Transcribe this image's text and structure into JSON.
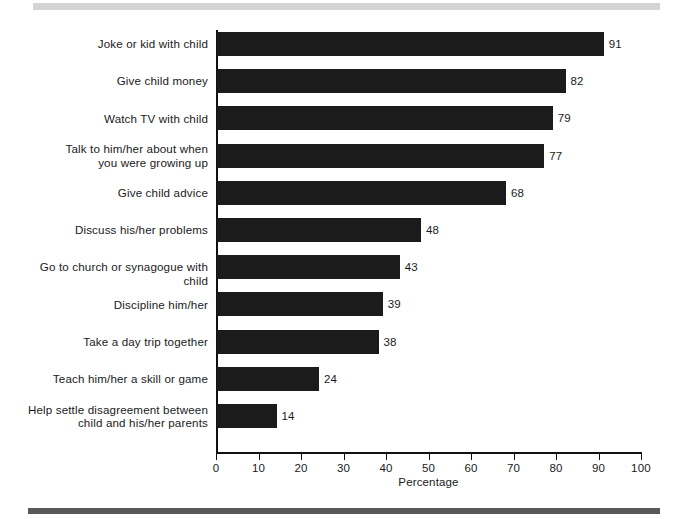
{
  "chart_data": {
    "type": "bar",
    "orientation": "horizontal",
    "title": "",
    "xlabel": "Percentage",
    "ylabel": "",
    "xlim": [
      0,
      100
    ],
    "xticks": [
      0,
      10,
      20,
      30,
      40,
      50,
      60,
      70,
      80,
      90,
      100
    ],
    "grid": false,
    "legend": null,
    "bar_color": "#1b1b1b",
    "show_value_labels": true,
    "categories": [
      "Joke or kid with child",
      "Give child money",
      "Watch TV with child",
      "Talk to him/her about when\nyou were growing up",
      "Give child advice",
      "Discuss his/her problems",
      "Go to church or synagogue with child",
      "Discipline him/her",
      "Take a day trip together",
      "Teach him/her a skill or game",
      "Help settle disagreement between\nchild and his/her parents"
    ],
    "values": [
      91,
      82,
      79,
      77,
      68,
      48,
      43,
      39,
      38,
      24,
      14
    ],
    "value_labels": [
      "91",
      "82",
      "79",
      "77",
      "68",
      "48",
      "43",
      "39",
      "38",
      "24",
      "14"
    ],
    "xtick_labels": [
      "0",
      "10",
      "20",
      "30",
      "40",
      "50",
      "60",
      "70",
      "80",
      "90",
      "100"
    ]
  },
  "decorations": {
    "rule_top_color": "#d4d4d4",
    "rule_bottom_color": "#595959"
  }
}
